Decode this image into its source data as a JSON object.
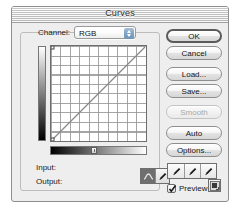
{
  "dialog": {
    "title": "Curves"
  },
  "channel": {
    "label": "Channel:",
    "value": "RGB",
    "options": [
      "RGB",
      "Red",
      "Green",
      "Blue"
    ],
    "stepper_icon": "up-down-arrows-icon"
  },
  "graph": {
    "grid_divisions": 10,
    "vertical_ramp": "white-to-black-gradient",
    "horizontal_ramp": "black-to-white-gradient",
    "curve": "identity-diagonal-line"
  },
  "readouts": {
    "input_label": "Input:",
    "input_value": "",
    "output_label": "Output:",
    "output_value": ""
  },
  "tools": {
    "curve_tool_icon": "curve-tool-icon",
    "pencil_tool_icon": "pencil-tool-icon",
    "selected": "curve-tool"
  },
  "buttons": [
    {
      "label": "OK",
      "state": "default"
    },
    {
      "label": "Cancel",
      "state": "normal"
    },
    {
      "label": "Load...",
      "state": "normal"
    },
    {
      "label": "Save...",
      "state": "normal"
    },
    {
      "label": "Smooth",
      "state": "disabled"
    },
    {
      "label": "Auto",
      "state": "normal"
    },
    {
      "label": "Options...",
      "state": "normal"
    }
  ],
  "eyedroppers": [
    {
      "name": "set-black-point-eyedropper"
    },
    {
      "name": "set-gray-point-eyedropper"
    },
    {
      "name": "set-white-point-eyedropper"
    }
  ],
  "preview": {
    "label": "Preview",
    "checked": true
  },
  "corner": {
    "icon": "curve-display-toggle-icon"
  },
  "colors": {
    "dialog_bg": "#eeeeee",
    "titlebar_bg": "#d8d8d8",
    "border": "#8f8f8f",
    "stepper_blue": "#7fa3c4",
    "text": "#151515",
    "disabled_text": "#a8a8a8"
  }
}
